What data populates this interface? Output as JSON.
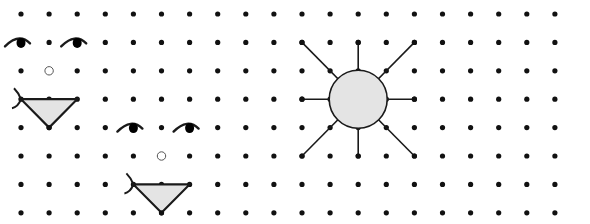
{
  "grid": {
    "x0": 21,
    "dx": 28.1,
    "cols": 20,
    "y0": 14,
    "dy": 28.4,
    "rows": 8,
    "dot_radius": 2.6,
    "dot_color": "#111111"
  },
  "colors": {
    "fill": "#e4e4e4",
    "stroke": "#1a1a1a",
    "background": "#ffffff"
  },
  "faces": [
    {
      "name": "face-large",
      "eyes": [
        {
          "col": 0,
          "row": 1
        },
        {
          "col": 2,
          "row": 1
        }
      ],
      "nose": {
        "col": 1,
        "row": 2
      },
      "mouth": {
        "left": {
          "col": 0,
          "row": 3
        },
        "right": {
          "col": 2,
          "row": 3
        },
        "bottom": {
          "col": 1,
          "row": 4
        }
      }
    },
    {
      "name": "face-small",
      "eyes": [
        {
          "col": 4,
          "row": 4
        },
        {
          "col": 6,
          "row": 4
        }
      ],
      "nose": {
        "col": 5,
        "row": 5
      },
      "mouth": {
        "left": {
          "col": 4,
          "row": 6
        },
        "right": {
          "col": 6,
          "row": 6
        },
        "bottom": {
          "col": 5,
          "row": 7
        }
      }
    }
  ],
  "sun": {
    "center": {
      "col": 12,
      "row": 3
    },
    "radius_px": 29,
    "ray_endpoints": [
      {
        "col": 10,
        "row": 1
      },
      {
        "col": 12,
        "row": 1
      },
      {
        "col": 14,
        "row": 1
      },
      {
        "col": 10,
        "row": 3
      },
      {
        "col": 14,
        "row": 3
      },
      {
        "col": 10,
        "row": 5
      },
      {
        "col": 12,
        "row": 5
      },
      {
        "col": 14,
        "row": 5
      }
    ]
  }
}
